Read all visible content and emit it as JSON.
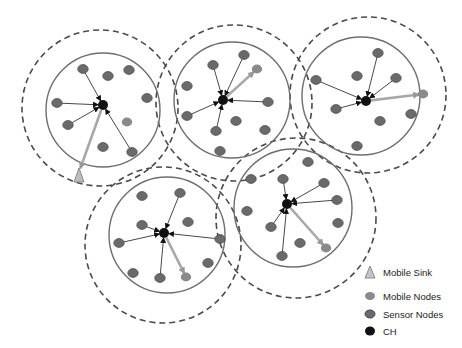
{
  "diagram": {
    "type": "clustered wireless sensor network with mobile sink",
    "colors": {
      "background": "#ffffff",
      "cluster_boundary": "#6e6e6e",
      "range_boundary": "#4a4a4a",
      "sensor_node": "#6a6a6a",
      "sensor_node_stroke": "#4e4e4e",
      "mobile_node": "#8a8a8a",
      "cluster_head": "#111111",
      "link": "#333333",
      "mobile_link": "#a8a8a8",
      "mobile_sink": "#bdbdbd"
    },
    "clusters": [
      {
        "id": "cluster-1",
        "solid": {
          "cx": 103,
          "cy": 110,
          "r": 57
        },
        "dashed": {
          "cx": 100,
          "cy": 108,
          "r": 78
        },
        "ch": {
          "x": 103,
          "y": 105
        },
        "nodes": [
          {
            "x": 83,
            "y": 69,
            "linked": true
          },
          {
            "x": 108,
            "y": 76,
            "linked": false
          },
          {
            "x": 129,
            "y": 70,
            "linked": false
          },
          {
            "x": 147,
            "y": 98,
            "linked": false
          },
          {
            "x": 57,
            "y": 103,
            "linked": true
          },
          {
            "x": 68,
            "y": 125,
            "linked": true
          },
          {
            "x": 127,
            "y": 122,
            "linked": false,
            "mobile": true
          },
          {
            "x": 103,
            "y": 147,
            "linked": false
          },
          {
            "x": 132,
            "y": 152,
            "linked": true
          }
        ],
        "mobile_link": {
          "x": 79,
          "y": 172
        }
      },
      {
        "id": "cluster-2",
        "solid": {
          "cx": 232,
          "cy": 100,
          "r": 58
        },
        "dashed": {
          "cx": 234,
          "cy": 103,
          "r": 78
        },
        "ch": {
          "x": 223,
          "y": 100
        },
        "nodes": [
          {
            "x": 213,
            "y": 65,
            "linked": true
          },
          {
            "x": 244,
            "y": 55,
            "linked": true
          },
          {
            "x": 257,
            "y": 69,
            "linked": false,
            "mobile": true
          },
          {
            "x": 187,
            "y": 86,
            "linked": false
          },
          {
            "x": 268,
            "y": 102,
            "linked": true
          },
          {
            "x": 187,
            "y": 116,
            "linked": true
          },
          {
            "x": 236,
            "y": 121,
            "linked": false
          },
          {
            "x": 216,
            "y": 131,
            "linked": true
          },
          {
            "x": 265,
            "y": 130,
            "linked": false
          },
          {
            "x": 220,
            "y": 151,
            "linked": false
          }
        ],
        "mobile_link": {
          "x": 257,
          "y": 69
        }
      },
      {
        "id": "cluster-3",
        "solid": {
          "cx": 361,
          "cy": 96,
          "r": 59
        },
        "dashed": {
          "cx": 368,
          "cy": 95,
          "r": 78
        },
        "ch": {
          "x": 366,
          "y": 101
        },
        "nodes": [
          {
            "x": 378,
            "y": 53,
            "linked": true
          },
          {
            "x": 357,
            "y": 76,
            "linked": false
          },
          {
            "x": 396,
            "y": 78,
            "linked": true
          },
          {
            "x": 316,
            "y": 80,
            "linked": true
          },
          {
            "x": 423,
            "y": 94,
            "linked": false,
            "mobile": true
          },
          {
            "x": 336,
            "y": 109,
            "linked": true
          },
          {
            "x": 411,
            "y": 114,
            "linked": false
          },
          {
            "x": 380,
            "y": 121,
            "linked": false
          },
          {
            "x": 357,
            "y": 146,
            "linked": false
          }
        ],
        "mobile_link": {
          "x": 423,
          "y": 94
        }
      },
      {
        "id": "cluster-4",
        "solid": {
          "cx": 167,
          "cy": 235,
          "r": 58
        },
        "dashed": {
          "cx": 163,
          "cy": 245,
          "r": 78
        },
        "ch": {
          "x": 164,
          "y": 233
        },
        "nodes": [
          {
            "x": 142,
            "y": 196,
            "linked": false
          },
          {
            "x": 180,
            "y": 193,
            "linked": true
          },
          {
            "x": 142,
            "y": 225,
            "linked": true
          },
          {
            "x": 188,
            "y": 222,
            "linked": false
          },
          {
            "x": 119,
            "y": 243,
            "linked": true
          },
          {
            "x": 220,
            "y": 239,
            "linked": true
          },
          {
            "x": 208,
            "y": 263,
            "linked": false
          },
          {
            "x": 133,
            "y": 273,
            "linked": false
          },
          {
            "x": 160,
            "y": 278,
            "linked": true
          },
          {
            "x": 186,
            "y": 277,
            "linked": false,
            "mobile": true
          }
        ],
        "mobile_link": {
          "x": 186,
          "y": 277
        }
      },
      {
        "id": "cluster-5",
        "solid": {
          "cx": 293,
          "cy": 208,
          "r": 59
        },
        "dashed": {
          "cx": 296,
          "cy": 218,
          "r": 80
        },
        "ch": {
          "x": 287,
          "y": 204
        },
        "nodes": [
          {
            "x": 308,
            "y": 162,
            "linked": false
          },
          {
            "x": 251,
            "y": 179,
            "linked": false
          },
          {
            "x": 283,
            "y": 179,
            "linked": true
          },
          {
            "x": 324,
            "y": 183,
            "linked": true
          },
          {
            "x": 337,
            "y": 200,
            "linked": true
          },
          {
            "x": 247,
            "y": 211,
            "linked": false
          },
          {
            "x": 338,
            "y": 223,
            "linked": false
          },
          {
            "x": 271,
            "y": 227,
            "linked": true
          },
          {
            "x": 300,
            "y": 243,
            "linked": false
          },
          {
            "x": 326,
            "y": 248,
            "linked": false,
            "mobile": true
          },
          {
            "x": 282,
            "y": 256,
            "linked": true
          }
        ],
        "mobile_link": {
          "x": 326,
          "y": 248
        }
      }
    ],
    "mobile_sink": {
      "x": 79,
      "y": 177
    }
  },
  "legend": {
    "items": [
      {
        "symbol": "triangle",
        "label": "Mobile Sink"
      },
      {
        "symbol": "mobile-node",
        "label": "Mobile Nodes"
      },
      {
        "symbol": "sensor-node",
        "label": "Sensor Nodes"
      },
      {
        "symbol": "cluster-head",
        "label": "CH"
      }
    ]
  }
}
